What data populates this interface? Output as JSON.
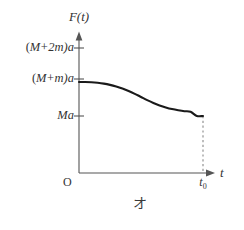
{
  "figure": {
    "caption": "オ",
    "ink_color": "#333333",
    "curve_color": "#1a1a1a",
    "axis_color": "#555555",
    "dashed_color": "#999999",
    "background": "#ffffff"
  },
  "axes": {
    "y_label": "F(t)",
    "x_label": "t",
    "origin_label": "O"
  },
  "y_ticks": [
    {
      "label_prefix": "(",
      "label_m": "M",
      "label_op": "+",
      "label_n": "2m",
      "label_suffix": ")a",
      "full": "(M+2m)a"
    },
    {
      "label_prefix": "(",
      "label_m": "M",
      "label_op": "+",
      "label_n": "m",
      "label_suffix": ")a",
      "full": "(M+m)a"
    },
    {
      "full": "Ma"
    }
  ],
  "x_ticks": [
    {
      "base": "t",
      "sub": "0",
      "full": "t0"
    }
  ],
  "chart_data": {
    "type": "line",
    "title": "",
    "xlabel": "t",
    "ylabel": "F(t)",
    "xlim": [
      0,
      1.12
    ],
    "ylim": [
      0,
      1.25
    ],
    "grid": false,
    "legend": null,
    "y_tick_values": [
      1.0,
      0.75,
      0.5
    ],
    "y_tick_labels": [
      "(M+2m)a",
      "(M+m)a",
      "Ma"
    ],
    "x_tick_values": [
      1.0
    ],
    "x_tick_labels": [
      "t0"
    ],
    "annotations": [
      {
        "text": "dashed drop line at t0 from Ma down to t-axis",
        "x": 1.0
      }
    ],
    "series": [
      {
        "name": "F(t)",
        "comment": "Smooth sigmoid decay from (M+m)a at t=0 to Ma at t=t0",
        "x": [
          0.0,
          0.05,
          0.1,
          0.15,
          0.2,
          0.25,
          0.3,
          0.35,
          0.4,
          0.45,
          0.5,
          0.55,
          0.6,
          0.65,
          0.7,
          0.75,
          0.8,
          0.85,
          0.9,
          0.95,
          1.0
        ],
        "y": [
          0.75,
          0.75,
          0.748,
          0.744,
          0.738,
          0.729,
          0.717,
          0.702,
          0.684,
          0.663,
          0.64,
          0.617,
          0.596,
          0.578,
          0.563,
          0.551,
          0.542,
          0.535,
          0.531,
          0.5005,
          0.5
        ]
      }
    ]
  }
}
